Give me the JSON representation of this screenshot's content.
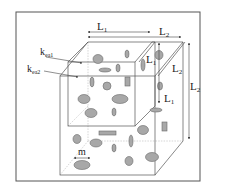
{
  "figure": {
    "colors": {
      "frame": "#444444",
      "edge": "#555555",
      "hidden_edge": "#aaaaaa",
      "inclusion_fill": "#a8a8a8",
      "inclusion_stroke": "#6a6a6a",
      "text": "#222222"
    },
    "labels": {
      "L1_top": "L",
      "L1_top_sub": "1",
      "L2_top": "L",
      "L2_top_sub": "2",
      "L1_right_inner": "L",
      "L1_right_inner_sub": "1",
      "L2_diag": "L",
      "L2_diag_sub": "2",
      "L2_right": "L",
      "L2_right_sub": "2",
      "L1_right_lower": "L",
      "L1_right_lower_sub": "1",
      "k_ea1": "k",
      "k_ea1_sub": "ea1",
      "k_ea2": "k",
      "k_ea2_sub": "ea2",
      "m": "m"
    }
  }
}
